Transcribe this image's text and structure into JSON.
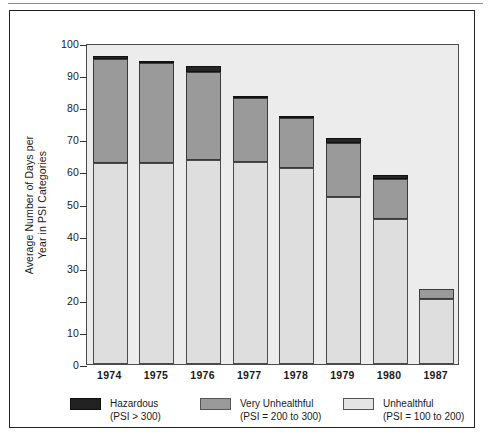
{
  "chart_data": {
    "type": "bar",
    "subtype": "stacked-bar",
    "title": "",
    "xlabel": "",
    "ylabel": "Average Number of Days per Year in PSI Categories",
    "ylabel_lines": [
      "Average Number of Days per",
      "Year in PSI Categories"
    ],
    "categories": [
      "1974",
      "1975",
      "1976",
      "1977",
      "1978",
      "1979",
      "1980",
      "1987"
    ],
    "ylim": [
      0,
      100
    ],
    "yticks": [
      0,
      10,
      20,
      30,
      40,
      50,
      60,
      70,
      80,
      90,
      100
    ],
    "ytick_labels": [
      "0",
      "10",
      "20",
      "30",
      "40",
      "50",
      "60",
      "70",
      "80",
      "90",
      "100"
    ],
    "grid": false,
    "legend_position": "bottom",
    "stack_order_bottom_to_top": [
      "Unhealthful",
      "Very Unhealthful",
      "Hazardous"
    ],
    "series": [
      {
        "name": "Unhealthful",
        "key": "unh",
        "color": "#dedede",
        "values": [
          62.5,
          62.7,
          63.7,
          62.9,
          61.0,
          52.0,
          45.3,
          20.2
        ]
      },
      {
        "name": "Very Unhealthful",
        "key": "vun",
        "color": "#9a9a9a",
        "values": [
          32.5,
          31.0,
          27.4,
          20.0,
          15.6,
          17.0,
          12.4,
          3.3
        ]
      },
      {
        "name": "Hazardous",
        "key": "haz",
        "color": "#262626",
        "values": [
          1.0,
          0.8,
          1.6,
          0.7,
          0.8,
          1.4,
          1.2,
          0.0
        ]
      }
    ],
    "totals": [
      96.0,
      94.5,
      92.7,
      83.6,
      77.4,
      70.4,
      58.9,
      23.5
    ]
  },
  "legend": {
    "items": [
      {
        "swatch": "haz",
        "name": "Hazardous",
        "range": "(PSI > 300)"
      },
      {
        "swatch": "vun",
        "name": "Very Unhealthful",
        "range": "(PSI = 200 to 300)"
      },
      {
        "swatch": "unh",
        "name": "Unhealthful",
        "range": "(PSI = 100 to 200)"
      }
    ]
  },
  "colors": {
    "hazardous": "#262626",
    "very_unhealthful": "#9a9a9a",
    "unhealthful": "#dedede",
    "plot_background": "#ececec",
    "figure_background": "#ffffff",
    "axis": "#333333"
  }
}
